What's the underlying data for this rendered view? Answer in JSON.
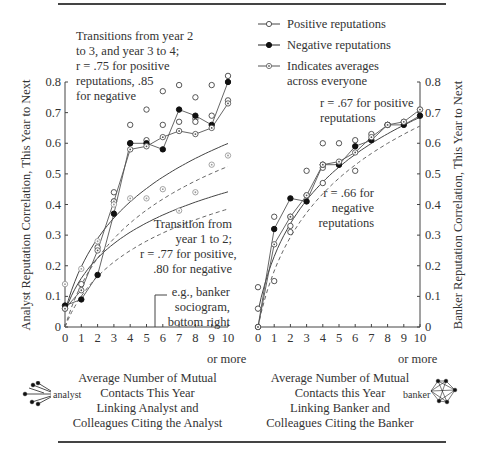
{
  "legend": {
    "positive": "Positive reputations",
    "negative": "Negative reputations",
    "average_line1": "Indicates averages",
    "average_line2": "across everyone"
  },
  "left_panel": {
    "annotation_top": [
      "Transitions from year 2",
      "to 3, and year 3 to 4;",
      "r = .75 for positive",
      "reputations, .85",
      "for negative"
    ],
    "annotation_mid": [
      "Transition from",
      "year 1 to 2;",
      "r = .77 for positive,",
      ".80 for  negative"
    ],
    "annotation_eg": [
      "e.g., banker",
      "sociogram,",
      "bottom right"
    ],
    "ylabel": "Analyst Reputation Correlation, This Year to Next",
    "xlabel": [
      "Average Number of Mutual",
      "Contacts This Year",
      "Linking Analyst and",
      "Colleagues Citing the Analyst"
    ],
    "x_or_more": "or more",
    "icon_label": "analyst"
  },
  "right_panel": {
    "annotation_pos": [
      "r = .67 for positive",
      "reputations"
    ],
    "annotation_neg": [
      "r = .66 for",
      "negative",
      "reputations"
    ],
    "ylabel": "Banker Reputation Correlation, This Year to Next",
    "xlabel": [
      "Average Number of Mutual",
      "Contacts this Year",
      "Linking Banker and",
      "Colleagues Citing the Banker"
    ],
    "x_or_more": "or more",
    "icon_label": "banker"
  },
  "axes": {
    "x_ticks": [
      "0",
      "1",
      "2",
      "3",
      "4",
      "5",
      "6",
      "7",
      "8",
      "9",
      "10"
    ],
    "y_ticks": [
      "0",
      "0.1",
      "0.2",
      "0.3",
      "0.4",
      "0.5",
      "0.6",
      "0.7",
      "0.8"
    ]
  },
  "chart_data": [
    {
      "type": "scatter",
      "title": "Analyst reputation stability",
      "xlabel": "Average Number of Mutual Contacts This Year Linking Analyst and Colleagues Citing the Analyst",
      "ylabel": "Analyst Reputation Correlation, This Year to Next",
      "xlim": [
        0,
        10
      ],
      "ylim": [
        0,
        0.8
      ],
      "grid": false,
      "legend_position": "top-right",
      "series": [
        {
          "name": "Positive reputations (years 2-3, 3-4)",
          "marker": "open-circle",
          "x": [
            0,
            1,
            2,
            3,
            3,
            4,
            4,
            5,
            5,
            6,
            6,
            7,
            7,
            8,
            8,
            8,
            9,
            9,
            10,
            10
          ],
          "y": [
            0.06,
            0.14,
            0.26,
            0.44,
            0.41,
            0.66,
            0.6,
            0.71,
            0.61,
            0.77,
            0.66,
            0.79,
            0.67,
            0.75,
            0.68,
            0.67,
            0.79,
            0.69,
            0.82,
            0.74
          ]
        },
        {
          "name": "Negative reputations (years 2-3, 3-4)",
          "marker": "filled-circle",
          "x": [
            0,
            1,
            2,
            3,
            4,
            5,
            6,
            7,
            8,
            9,
            10
          ],
          "y": [
            0.07,
            0.09,
            0.17,
            0.37,
            0.6,
            0.6,
            0.58,
            0.71,
            0.69,
            0.66,
            0.8
          ]
        },
        {
          "name": "Averages across everyone (years 2-3, 3-4)",
          "marker": "dotted-circle",
          "x": [
            0,
            1,
            2,
            3,
            4,
            5,
            6,
            7,
            8,
            9,
            10
          ],
          "y": [
            0.06,
            0.12,
            0.25,
            0.41,
            0.58,
            0.59,
            0.62,
            0.64,
            0.63,
            0.65,
            0.73
          ]
        },
        {
          "name": "Averages across everyone (year 1-2)",
          "marker": "dotted-circle-gray",
          "x": [
            0,
            1,
            2,
            3,
            4,
            5,
            6,
            7,
            8,
            9,
            10
          ],
          "y": [
            0.14,
            0.19,
            0.28,
            0.4,
            0.42,
            0.42,
            0.45,
            0.38,
            0.44,
            0.53,
            0.56
          ]
        }
      ],
      "annotations": [
        "Transitions from year 2 to 3, and year 3 to 4; r = .75 for positive reputations, .85 for negative",
        "Transition from year 1 to 2; r = .77 for positive, .80 for negative",
        "e.g., banker sociogram, bottom right"
      ]
    },
    {
      "type": "scatter",
      "title": "Banker reputation stability",
      "xlabel": "Average Number of Mutual Contacts this Year Linking Banker and Colleagues Citing the Banker",
      "ylabel": "Banker Reputation Correlation, This Year to Next",
      "xlim": [
        0,
        10
      ],
      "ylim": [
        0,
        0.8
      ],
      "grid": false,
      "series": [
        {
          "name": "Positive reputations",
          "marker": "open-circle",
          "x": [
            0,
            0,
            0,
            1,
            1,
            2,
            2,
            2,
            3,
            3,
            4,
            4,
            4,
            5,
            5,
            6,
            6,
            7,
            8,
            9,
            10
          ],
          "y": [
            0.0,
            0.06,
            0.13,
            0.36,
            0.15,
            0.36,
            0.33,
            0.31,
            0.43,
            0.51,
            0.47,
            0.6,
            0.52,
            0.6,
            0.53,
            0.61,
            0.51,
            0.63,
            0.66,
            0.67,
            0.71
          ]
        },
        {
          "name": "Negative reputations",
          "marker": "filled-circle",
          "x": [
            0,
            1,
            2,
            3,
            4,
            5,
            6,
            7,
            8,
            9,
            10
          ],
          "y": [
            0.0,
            0.32,
            0.42,
            0.41,
            0.53,
            0.53,
            0.59,
            0.61,
            0.66,
            0.66,
            0.69
          ]
        },
        {
          "name": "Averages across everyone",
          "marker": "dotted-circle",
          "x": [
            0,
            1,
            2,
            3,
            4,
            5,
            6,
            7,
            8,
            9,
            10
          ],
          "y": [
            0.0,
            0.27,
            0.36,
            0.43,
            0.53,
            0.54,
            0.57,
            0.62,
            0.66,
            0.67,
            0.71
          ]
        }
      ],
      "annotations": [
        "r = .67 for positive reputations",
        "r = .66 for negative reputations"
      ]
    }
  ]
}
